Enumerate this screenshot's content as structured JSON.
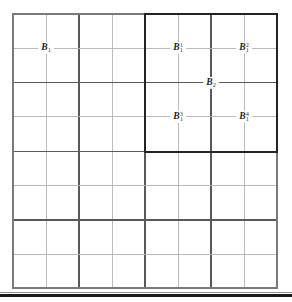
{
  "figure": {
    "kind": "dyadic-grid-diagram",
    "background_color": "#ffffff",
    "grid": {
      "columns": 8,
      "rows": 8,
      "left": 13,
      "top": 14,
      "right": 277,
      "bottom": 288,
      "cell_width": 33,
      "cell_height": 34.25,
      "fine_line_color": "#b3b3b3",
      "coarse_line_color": "#59595c",
      "border_color": "#7a7a7d",
      "coarse_every": 2
    },
    "highlight_box": {
      "label": "selected-dyadic-region",
      "color": "#232326",
      "left": 145,
      "top": 14,
      "right": 277,
      "bottom": 152,
      "columns_spanned": 4,
      "rows_spanned": 4
    },
    "page_edge_rule": {
      "color": "#1a1a1a",
      "y": 295
    },
    "labels": [
      {
        "name": "label-b1",
        "text": "B₁",
        "base": "B",
        "superscript": "",
        "subscript": "1",
        "x": 46,
        "y": 48
      },
      {
        "name": "label-b1-sup1",
        "text": "B₁¹",
        "base": "B",
        "superscript": "1",
        "subscript": "1",
        "x": 178,
        "y": 48
      },
      {
        "name": "label-b1-sup2",
        "text": "B₁²",
        "base": "B",
        "superscript": "2",
        "subscript": "1",
        "x": 244,
        "y": 48
      },
      {
        "name": "label-b2",
        "text": "B₂",
        "base": "B",
        "superscript": "",
        "subscript": "2",
        "x": 211,
        "y": 83
      },
      {
        "name": "label-b1-sup3",
        "text": "B₁³",
        "base": "B",
        "superscript": "3",
        "subscript": "1",
        "x": 178,
        "y": 117
      },
      {
        "name": "label-b1-sup4",
        "text": "B₁⁴",
        "base": "B",
        "superscript": "4",
        "subscript": "1",
        "x": 244,
        "y": 117
      }
    ]
  }
}
